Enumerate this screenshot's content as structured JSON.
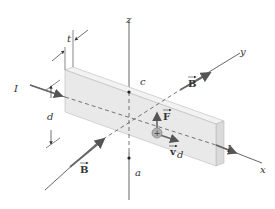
{
  "diagram": {
    "axes": {
      "x_label": "x",
      "y_label": "y",
      "z_label": "z"
    },
    "labels": {
      "current_in": "I",
      "current_out": "I",
      "thickness": "t",
      "height": "d",
      "point_top": "c",
      "point_bottom": "a",
      "field_upper": "B",
      "field_lower": "B",
      "force": "F",
      "drift_velocity": "v",
      "drift_subscript": "d",
      "charge_sign": "+"
    },
    "colors": {
      "slab_face": "#e8e8e8",
      "slab_top": "#f0f0f0",
      "slab_side": "#dcdcdc",
      "slab_edge": "#b8b8b8",
      "axis_line": "#555555",
      "arrow": "#666666",
      "charge": "#999999",
      "text": "#333333"
    }
  }
}
